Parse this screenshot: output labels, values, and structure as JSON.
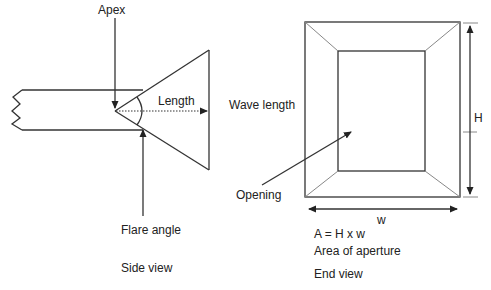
{
  "side_view": {
    "caption": "Side view",
    "labels": {
      "apex": "Apex",
      "length": "Length",
      "flare_angle": "Flare angle"
    }
  },
  "end_view": {
    "caption": "End view",
    "labels": {
      "wave_length": "Wave length",
      "opening": "Opening",
      "height": "H",
      "width": "w",
      "formula": "A = H x w",
      "area_description": "Area of aperture"
    }
  },
  "colors": {
    "line": "#333333",
    "light_line": "#888888",
    "text": "#222222",
    "background": "#ffffff"
  }
}
